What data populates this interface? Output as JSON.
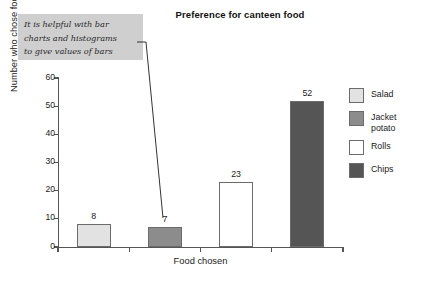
{
  "chart_data": {
    "type": "bar",
    "title": "Preference for canteen food",
    "xlabel": "Food chosen",
    "ylabel": "Number who chose food",
    "categories": [
      "Salad",
      "Jacket potato",
      "Rolls",
      "Chips"
    ],
    "values": [
      8,
      7,
      23,
      52
    ],
    "value_labels": [
      "8",
      "7",
      "23",
      "52"
    ],
    "ylim": [
      0,
      60
    ],
    "ytick_labels": [
      "0",
      "10",
      "20",
      "30",
      "40",
      "50",
      "60"
    ],
    "ytick_values": [
      0,
      10,
      20,
      30,
      40,
      50,
      60
    ],
    "grid": false,
    "legend_position": "right",
    "series": [
      {
        "name": "Preference for canteen food",
        "values": [
          8,
          7,
          23,
          52
        ]
      }
    ],
    "bar_colors": [
      "#e2e2e2",
      "#8c8c8c",
      "#ffffff",
      "#555555"
    ],
    "annotations": [
      {
        "text": "It is helpful with bar\ncharts and histograms\nto give values of bars",
        "points_to": "bar-value-label"
      }
    ]
  },
  "annotation": {
    "text": "It is helpful with bar\ncharts and histograms\nto give values of bars"
  },
  "legend": {
    "items": [
      {
        "label": "Salad",
        "color": "#e2e2e2"
      },
      {
        "label": "Jacket\npotato",
        "color": "#8c8c8c"
      },
      {
        "label": "Rolls",
        "color": "#ffffff"
      },
      {
        "label": "Chips",
        "color": "#555555"
      }
    ]
  }
}
